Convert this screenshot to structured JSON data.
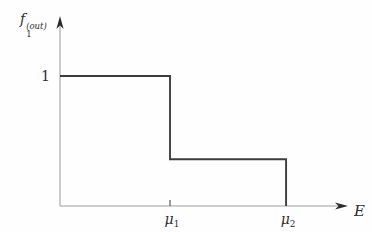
{
  "figure": {
    "background": "#fefefe",
    "curve_color": "#3d3d3d",
    "axis_color": "#9e9e9e",
    "arrow_color": "#2b2b2b",
    "text_color": "#2e2e2e",
    "y_axis_label": {
      "base": "f",
      "sub": "1",
      "sup": "(out)"
    },
    "x_axis_label": "E",
    "y_tick_label": "1",
    "x_tick_1": {
      "base": "μ",
      "sub": "1"
    },
    "x_tick_2": {
      "base": "μ",
      "sub": "2"
    }
  },
  "chart_data": {
    "type": "line",
    "subtype": "step-function",
    "title": "",
    "xlabel": "E",
    "ylabel": "f_1^(out)",
    "x_tick_labels": [
      "μ_1",
      "μ_2"
    ],
    "y_tick_labels": [
      "1"
    ],
    "grid": false,
    "legend": false,
    "points_data_units": [
      {
        "x": "0",
        "y": 1
      },
      {
        "x": "mu_1",
        "y": 1
      },
      {
        "x": "mu_1",
        "y": 0.36
      },
      {
        "x": "mu_2",
        "y": 0.36
      },
      {
        "x": "mu_2",
        "y": 0
      }
    ],
    "render": {
      "mu1_axis_fraction": 0.382,
      "mu2_axis_fraction": 0.785,
      "unit_axis_fraction": 0.684,
      "levels": [
        1,
        0.36
      ]
    }
  }
}
